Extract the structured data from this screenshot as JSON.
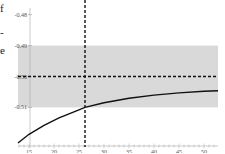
{
  "left_text_fragments": [
    "f",
    "-",
    "e"
  ],
  "chart_data": {
    "type": "line",
    "title": "",
    "xlabel": "",
    "ylabel": "",
    "xlim": [
      12.8,
      52.8
    ],
    "ylim": [
      -0.5215,
      -0.4785
    ],
    "x_ticks": [
      15,
      20,
      25,
      30,
      35,
      40,
      45,
      50
    ],
    "x_tick_labels": [
      "15",
      "20",
      "25",
      "30",
      "35",
      "40",
      "45",
      "50"
    ],
    "y_ticks": [
      -0.48,
      -0.49,
      -0.5,
      -0.51
    ],
    "y_tick_labels": [
      "-0.48",
      "-0.49",
      "-0.50",
      "-0.51"
    ],
    "grid": false,
    "legend": null,
    "shaded_band": {
      "y_min": -0.51,
      "y_max": -0.49,
      "color": "#d9d9d9"
    },
    "reference_lines": [
      {
        "orientation": "horizontal",
        "value": -0.5,
        "style": "dashed",
        "color": "#111111"
      },
      {
        "orientation": "vertical",
        "value": 26.2,
        "style": "dashed",
        "color": "#111111"
      }
    ],
    "series": [
      {
        "name": "curve",
        "color": "#111111",
        "x": [
          12.8,
          15,
          18,
          21,
          24,
          26.2,
          30,
          35,
          40,
          45,
          50,
          52.8
        ],
        "y": [
          -0.5215,
          -0.5187,
          -0.5158,
          -0.5134,
          -0.5114,
          -0.51,
          -0.5085,
          -0.507,
          -0.506,
          -0.5053,
          -0.5048,
          -0.5046
        ]
      }
    ]
  }
}
